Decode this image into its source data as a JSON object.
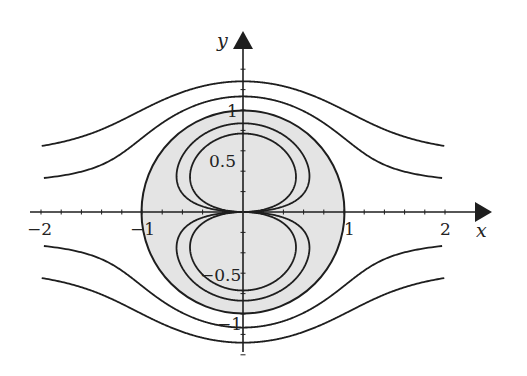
{
  "chart_data": {
    "type": "line",
    "title": "",
    "xlabel": "x",
    "ylabel": "y",
    "xlim": [
      -2,
      2
    ],
    "ylim": [
      -1.35,
      1.35
    ],
    "x_ticks": [
      "-2",
      "-1",
      "1",
      "2"
    ],
    "y_ticks": [
      "1",
      "0.5",
      "-0.5",
      "-1"
    ],
    "minor_tick_step": 0.2,
    "grid": false,
    "legend": null,
    "shaded_region": {
      "shape": "circle",
      "center": [
        0,
        0
      ],
      "radius": 1,
      "fill": "#e4e4e4"
    },
    "stream_function": "y*(1 - 1/(x^2+y^2))",
    "series": [
      {
        "name": "outer-top-1",
        "psi": 0.5,
        "region": "outside",
        "y_at_x0": 1.27,
        "y_at_x2": 0.65
      },
      {
        "name": "outer-top-2",
        "psi": 0.25,
        "region": "outside",
        "y_at_x0": 1.13,
        "y_at_x2": 0.32
      },
      {
        "name": "outer-bottom-1",
        "psi": -0.25,
        "region": "outside",
        "y_at_x0": -1.13,
        "y_at_x2": -0.32
      },
      {
        "name": "outer-bottom-2",
        "psi": -0.5,
        "region": "outside",
        "y_at_x0": -1.27,
        "y_at_x2": -0.65
      },
      {
        "name": "cylinder",
        "psi": 0,
        "region": "boundary",
        "radius": 1
      },
      {
        "name": "inner-top-1",
        "psi": -0.28,
        "region": "inside",
        "y_at_x0": 0.87
      },
      {
        "name": "inner-top-2",
        "psi": -0.53,
        "region": "inside",
        "y_at_x0": 0.77
      },
      {
        "name": "inner-bottom-1",
        "psi": 0.28,
        "region": "inside",
        "y_at_x0": -0.87
      },
      {
        "name": "inner-bottom-2",
        "psi": 0.53,
        "region": "inside",
        "y_at_x0": -0.77
      }
    ]
  },
  "labels": {
    "x_axis": "x",
    "y_axis": "y",
    "x_neg2": "−2",
    "x_neg1": "−1",
    "x_pos1": "1",
    "x_pos2": "2",
    "y_pos1": "1",
    "y_pos05": "0.5",
    "y_neg05": "−0.5",
    "y_neg1": "−1"
  },
  "colors": {
    "line": "#1e1e1e",
    "disk_fill": "#e4e4e4",
    "background": "#ffffff"
  }
}
